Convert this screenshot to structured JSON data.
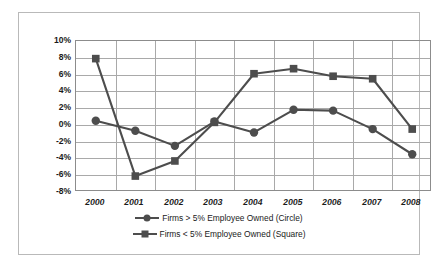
{
  "chart_data": {
    "type": "line",
    "title": "",
    "xlabel": "",
    "ylabel": "",
    "categories": [
      "2000",
      "2001",
      "2002",
      "2003",
      "2004",
      "2005",
      "2006",
      "2007",
      "2008"
    ],
    "ylim": [
      -8,
      10
    ],
    "ytick_labels": [
      "10%",
      "8%",
      "6%",
      "4%",
      "2%",
      "0%",
      "-2%",
      "-4%",
      "-6%",
      "-8%"
    ],
    "ytick_values": [
      10,
      8,
      6,
      4,
      2,
      0,
      -2,
      -4,
      -6,
      -8
    ],
    "grid": true,
    "legend_position": "bottom",
    "series": [
      {
        "name": "Firms > 5% Employee Owned (Circle)",
        "marker": "circle",
        "color": "#4d4d4d",
        "values": [
          0.5,
          -0.7,
          -2.5,
          0.4,
          -0.9,
          1.8,
          1.7,
          -0.5,
          -3.5
        ]
      },
      {
        "name": "Firms < 5% Employee Owned (Square)",
        "marker": "square",
        "color": "#4d4d4d",
        "values": [
          7.9,
          -6.1,
          -4.3,
          0.3,
          6.1,
          6.7,
          5.8,
          5.5,
          -0.5
        ]
      }
    ]
  },
  "legend": {
    "entries": [
      {
        "label": "Firms > 5% Employee Owned (Circle)",
        "marker": "circle"
      },
      {
        "label": "Firms < 5% Employee Owned (Square)",
        "marker": "square"
      }
    ]
  },
  "colors": {
    "series": "#4d4d4d",
    "grid": "#a9a9a9",
    "axis": "#8c8c8c",
    "border": "#b9b9b9",
    "text": "#1a1a1a",
    "background": "#ffffff"
  }
}
